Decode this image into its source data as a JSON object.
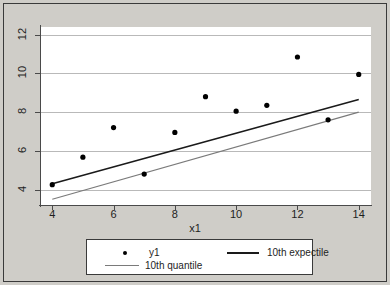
{
  "chart_data": {
    "type": "scatter",
    "title": "",
    "xlabel": "x1",
    "ylabel": "",
    "xlim": [
      3.6,
      14.4
    ],
    "ylim": [
      3.2,
      12.4
    ],
    "xticks": [
      "4",
      "6",
      "8",
      "10",
      "12",
      "14"
    ],
    "yticks": [
      "4",
      "6",
      "8",
      "10",
      "12"
    ],
    "grid": "horizontal",
    "legend_position": "bottom",
    "series": [
      {
        "name": "y1",
        "type": "scatter",
        "marker": "filled-circle",
        "color": "#000000",
        "x": [
          4,
          5,
          6,
          7,
          8,
          9,
          10,
          11,
          12,
          13,
          14
        ],
        "values": [
          4.25,
          5.67,
          7.2,
          4.8,
          6.95,
          8.8,
          8.05,
          8.35,
          10.85,
          7.6,
          9.95
        ]
      },
      {
        "name": "10th expectile",
        "type": "line",
        "color": "#1a1a1a",
        "x": [
          4,
          14
        ],
        "values": [
          4.3,
          8.65
        ]
      },
      {
        "name": "10th quantile",
        "type": "line",
        "color": "#7a7a7a",
        "x": [
          4,
          14
        ],
        "values": [
          3.5,
          8.0
        ]
      }
    ]
  },
  "legend": {
    "entries": [
      {
        "label": "y1",
        "key": "marker"
      },
      {
        "label": "10th expectile",
        "key": "line-dark"
      },
      {
        "label": "10th quantile",
        "key": "line-light"
      }
    ]
  },
  "colors": {
    "figure_background": "#cfcdc8",
    "plot_background": "#ffffff",
    "gridline": "#b9b9b9",
    "axis": "#4a4a4a",
    "expectile_line": "#1a1a1a",
    "quantile_line": "#7a7a7a",
    "marker": "#000000",
    "text": "#1e1e1e"
  }
}
